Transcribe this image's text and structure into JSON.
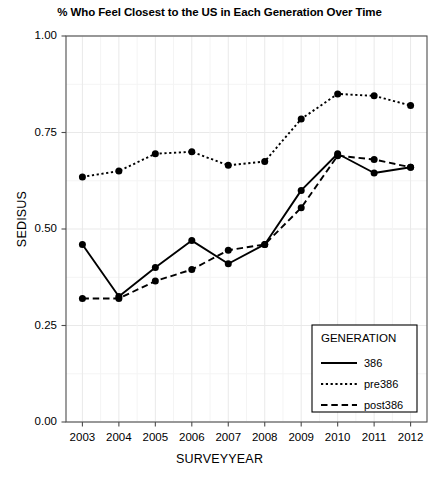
{
  "chart_data": {
    "type": "line",
    "title": "% Who Feel Closest to the US in Each Generation Over Time",
    "xlabel": "SURVEYYEAR",
    "ylabel": "SEDISUS",
    "x": [
      2003,
      2004,
      2005,
      2006,
      2007,
      2008,
      2009,
      2010,
      2011,
      2012
    ],
    "xtick_labels": [
      "2003",
      "2004",
      "2005",
      "2006",
      "2007",
      "2008",
      "2009",
      "2010",
      "2011",
      "2012"
    ],
    "ytick_labels": [
      "0.00",
      "0.25",
      "0.50",
      "0.75",
      "1.00"
    ],
    "yticks": [
      0.0,
      0.25,
      0.5,
      0.75,
      1.0
    ],
    "ylim": [
      0.0,
      1.0
    ],
    "xlim": [
      2002.55,
      2012.45
    ],
    "grid": true,
    "legend_position": "bottom-right",
    "legend_title": "GENERATION",
    "series": [
      {
        "name": "386",
        "style": "solid",
        "color": "#000000",
        "values": [
          0.46,
          0.325,
          0.4,
          0.47,
          0.41,
          0.46,
          0.6,
          0.695,
          0.645,
          0.66
        ]
      },
      {
        "name": "pre386",
        "style": "dotted",
        "color": "#000000",
        "values": [
          0.635,
          0.65,
          0.695,
          0.7,
          0.665,
          0.675,
          0.785,
          0.85,
          0.845,
          0.82
        ]
      },
      {
        "name": "post386",
        "style": "dashed",
        "color": "#000000",
        "values": [
          0.32,
          0.32,
          0.365,
          0.395,
          0.445,
          0.46,
          0.555,
          0.69,
          0.68,
          0.66
        ]
      }
    ]
  }
}
